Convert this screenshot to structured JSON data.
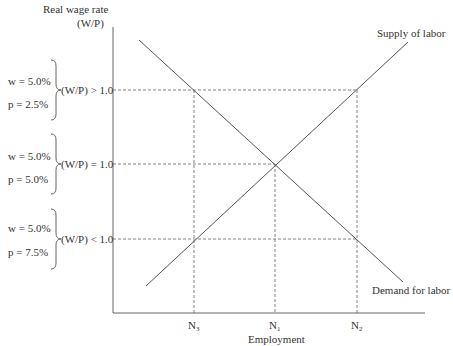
{
  "diagram": {
    "y_axis_label_line1": "Real wage rate",
    "y_axis_label_line2": "(W/P)",
    "x_axis_label": "Employment",
    "curves": {
      "supply": "Supply of labor",
      "demand": "Demand for labor"
    },
    "x_ticks": [
      {
        "base": "N",
        "sub": "3"
      },
      {
        "base": "N",
        "sub": "1"
      },
      {
        "base": "N",
        "sub": "2"
      }
    ],
    "groups": [
      {
        "w": "w = 5.0%",
        "p": "p = 2.5%",
        "ratio": "(W/P) > 1.0"
      },
      {
        "w": "w = 5.0%",
        "p": "p = 5.0%",
        "ratio": "(W/P) = 1.0"
      },
      {
        "w": "w = 5.0%",
        "p": "p = 7.5%",
        "ratio": "(W/P) < 1.0"
      }
    ],
    "colors": {
      "line": "#555555",
      "text": "#333333"
    }
  }
}
